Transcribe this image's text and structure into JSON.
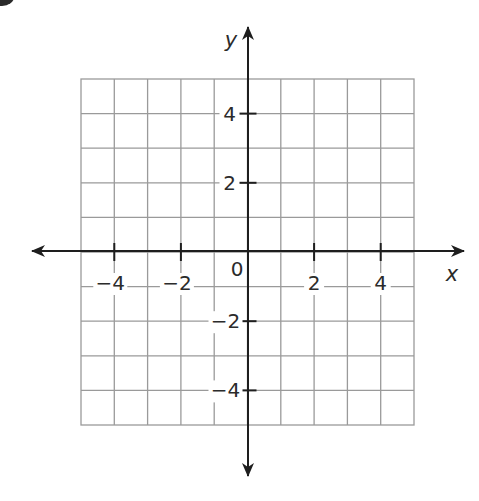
{
  "figure": {
    "type": "coordinate-plane",
    "x_axis": {
      "name": "x",
      "range": [
        -5,
        5
      ],
      "tick_labels": [
        {
          "value": -4,
          "label": "−4"
        },
        {
          "value": -2,
          "label": "−2"
        },
        {
          "value": 2,
          "label": "2"
        },
        {
          "value": 4,
          "label": "4"
        }
      ]
    },
    "y_axis": {
      "name": "y",
      "range": [
        -5,
        5
      ],
      "tick_labels": [
        {
          "value": 4,
          "label": "4"
        },
        {
          "value": 2,
          "label": "2"
        },
        {
          "value": -2,
          "label": "−2"
        },
        {
          "value": -4,
          "label": "−4"
        }
      ]
    },
    "origin_label": "0",
    "grid": {
      "rows": 10,
      "cols": 10,
      "line_color": "#9a9a9a",
      "axis_color": "#1e1e1e"
    }
  }
}
